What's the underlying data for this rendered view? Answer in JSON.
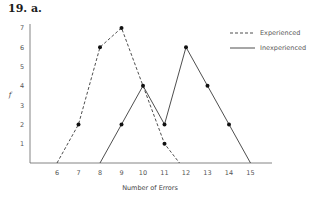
{
  "heading": "19.  a.",
  "chart_data": {
    "type": "line",
    "title": "",
    "xlabel": "Number of Errors",
    "ylabel": "f",
    "x_ticks": [
      6,
      7,
      8,
      9,
      10,
      11,
      12,
      13,
      14,
      15
    ],
    "y_ticks": [
      1,
      2,
      3,
      4,
      5,
      6,
      7
    ],
    "xlim": [
      4.7,
      16
    ],
    "ylim": [
      0,
      7
    ],
    "grid": false,
    "legend_position": "upper right",
    "series": [
      {
        "name": "Experienced",
        "style": "dashed",
        "x": [
          6,
          7,
          8,
          9,
          10,
          11,
          11.7
        ],
        "y": [
          0,
          2,
          6,
          7,
          4,
          1,
          0
        ],
        "markers": [
          [
            7,
            2
          ],
          [
            8,
            6
          ],
          [
            9,
            7
          ],
          [
            11,
            1
          ]
        ]
      },
      {
        "name": "Inexperienced",
        "style": "solid",
        "x": [
          8,
          9,
          10,
          11,
          12,
          13,
          14,
          15
        ],
        "y": [
          0,
          2,
          4,
          2,
          6,
          4,
          2,
          0
        ],
        "markers": [
          [
            9,
            2
          ],
          [
            10,
            4
          ],
          [
            11,
            2
          ],
          [
            12,
            6
          ],
          [
            13,
            4
          ],
          [
            14,
            2
          ]
        ]
      }
    ]
  },
  "legend": {
    "items": [
      {
        "label": "Experienced",
        "style": "dashed"
      },
      {
        "label": "Inexperienced",
        "style": "solid"
      }
    ]
  },
  "colors": {
    "line": "#3a3a3a",
    "axis": "#666666",
    "marker": "#111111"
  }
}
